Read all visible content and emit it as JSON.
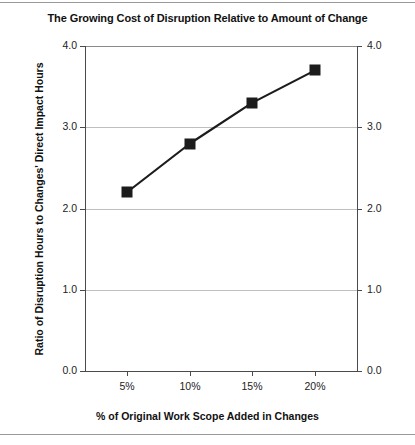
{
  "chart_data": {
    "type": "line",
    "title": "The Growing Cost of Disruption Relative to Amount of Change",
    "xlabel": "% of Original Work Scope Added in Changes",
    "ylabel": "Ratio of Disruption Hours to Changes' Direct Impact Hours",
    "categories": [
      "5%",
      "10%",
      "15%",
      "20%"
    ],
    "x": [
      5,
      10,
      15,
      20
    ],
    "values": [
      2.2,
      2.8,
      3.3,
      3.7
    ],
    "series": [
      {
        "name": "Ratio of Disruption Hours to Changes' Direct Impact Hours",
        "values": [
          2.2,
          2.8,
          3.3,
          3.7
        ]
      }
    ],
    "ylim": [
      0.0,
      4.0
    ],
    "ytick_labels_left": [
      "4.0",
      "3.0",
      "2.0",
      "1.0",
      "0.0"
    ],
    "ytick_labels_right": [
      "4.0",
      "3.0",
      "2.0",
      "1.0",
      "0.0"
    ],
    "ytick_values": [
      4.0,
      3.0,
      2.0,
      1.0,
      0.0
    ],
    "xtick_labels": [
      "5%",
      "10%",
      "15%",
      "20%"
    ],
    "grid": "horizontal",
    "legend": "none",
    "marker": "filled-square",
    "line_color": "#1c1c1c",
    "marker_color": "#1c1c1c",
    "grid_color": "#bfbfbf",
    "axis_color": "#4a4a4a",
    "background": "#ffffff"
  }
}
